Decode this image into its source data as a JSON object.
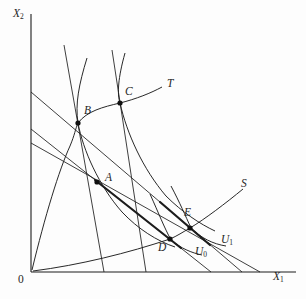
{
  "figure": {
    "background": "#fdfdfd",
    "ink_color": "#1c1c1c",
    "origin_label": "0",
    "axes": {
      "y_label": {
        "base": "X",
        "sub": "2"
      },
      "x_label": {
        "base": "X",
        "sub": "1"
      }
    },
    "points": {
      "A": {
        "x": 97,
        "y": 182,
        "label": "A"
      },
      "B": {
        "x": 78,
        "y": 123,
        "label": "B"
      },
      "C": {
        "x": 120,
        "y": 103,
        "label": "C"
      },
      "D": {
        "x": 170,
        "y": 239,
        "label": "D"
      },
      "E": {
        "x": 190,
        "y": 228,
        "label": "E"
      }
    },
    "curve_labels": {
      "T": {
        "base": "T",
        "sub": ""
      },
      "S": {
        "base": "S",
        "sub": ""
      },
      "U0": {
        "base": "U",
        "sub": "0"
      },
      "U1": {
        "base": "U",
        "sub": "1"
      }
    },
    "geometry": {
      "y_axis": "M31,14 L31,272",
      "x_axis": "M31,272 L296,272",
      "tangent_line_B": "M64,45 L104,272",
      "tangent_line_C": "M112,50 L146,272",
      "price_line_E": "M31,92 L242,272",
      "price_line_AD": "M31,129 L211,272",
      "budget_line_low": "M31,143 L260,272",
      "thick_segment_AD": "M95,180 L181,248",
      "thick_segment_E": "M160,202 L210,245",
      "curve_T": "M32,270 C45,216 59,170 70,146 C75,134 75,130 78,123 C87,111 103,107 120,103 C136,99 151,93 162,87",
      "curve_S": "M33,271 C80,265 128,253 170,239 C177,236 183,232 190,228 C205,219 226,203 243,189",
      "curve_indiff_B": "M87,58 C79,84 75,104 78,123 C83,150 99,186 122,212 C138,229 157,241 175,247",
      "curve_indiff_C": "M125,53 C118,78 117,94 120,103 C127,134 143,169 166,196 C182,212 200,224 215,231",
      "curve_U0": "M150,194 C159,214 164,227 171,240 C180,248 192,253 202,255",
      "curve_U1": "M171,186 C180,203 185,215 191,228 C201,238 213,244 226,246"
    }
  }
}
